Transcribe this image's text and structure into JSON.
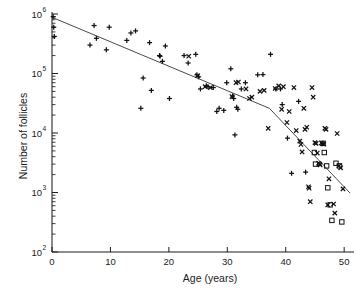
{
  "chart_data": {
    "type": "scatter",
    "title": "",
    "xlabel": "Age (years)",
    "ylabel": "Number of follicles",
    "xlim": [
      0,
      51
    ],
    "ylim": [
      100,
      1000000
    ],
    "yscale": "log",
    "xticks": [
      0,
      10,
      20,
      30,
      40,
      50
    ],
    "xticklabels": [
      "0",
      "10",
      "20",
      "30",
      "40",
      "50"
    ],
    "yticks": [
      100,
      1000,
      10000,
      100000,
      1000000
    ],
    "yticklabels": [
      "10²",
      "10³",
      "10⁴",
      "10⁵",
      "10⁶"
    ],
    "ytick_bases": [
      "10",
      "10",
      "10",
      "10",
      "10"
    ],
    "ytick_exponents": [
      "2",
      "3",
      "4",
      "5",
      "6"
    ],
    "grid": false,
    "legend": "none",
    "minor_ticks": "log-decade",
    "series": [
      {
        "name": "plus-marker-points",
        "marker": "plus",
        "points": [
          [
            0.2,
            900000
          ],
          [
            0.3,
            600000
          ],
          [
            0.4,
            420000
          ],
          [
            6.5,
            300000
          ],
          [
            7.2,
            640000
          ],
          [
            7.6,
            390000
          ],
          [
            9.3,
            250000
          ],
          [
            9.8,
            600000
          ],
          [
            12.8,
            360000
          ],
          [
            13.5,
            480000
          ],
          [
            14.3,
            520000
          ],
          [
            15.2,
            26000
          ],
          [
            15.6,
            84000
          ],
          [
            16.7,
            330000
          ],
          [
            17.0,
            52000
          ],
          [
            18.4,
            200000
          ],
          [
            18.5,
            195000
          ],
          [
            18.9,
            160000
          ],
          [
            19.4,
            290000
          ],
          [
            20.1,
            38000
          ],
          [
            22.6,
            200000
          ],
          [
            23.3,
            150000
          ],
          [
            24.6,
            210000
          ],
          [
            24.8,
            95000
          ],
          [
            25.1,
            88000
          ],
          [
            25.4,
            55000
          ],
          [
            26.4,
            62000
          ],
          [
            26.7,
            60000
          ],
          [
            27.6,
            58000
          ],
          [
            28.2,
            23000
          ],
          [
            28.6,
            26000
          ],
          [
            29.4,
            24000
          ],
          [
            29.9,
            70000
          ],
          [
            30.6,
            120000
          ],
          [
            30.9,
            42000
          ],
          [
            31.1,
            38000
          ],
          [
            31.3,
            9300
          ],
          [
            31.6,
            27000
          ],
          [
            31.8,
            25000
          ],
          [
            32.4,
            55000
          ],
          [
            33.1,
            70000
          ],
          [
            35.2,
            95000
          ],
          [
            36.1,
            96000
          ],
          [
            37.4,
            210000
          ],
          [
            38.3,
            55000
          ],
          [
            39.1,
            55000
          ],
          [
            39.4,
            30000
          ],
          [
            40.3,
            8200
          ],
          [
            41.0,
            2100
          ],
          [
            42.2,
            34000
          ],
          [
            43.4,
            2200
          ]
        ]
      },
      {
        "name": "cross-marker-points",
        "marker": "cross",
        "points": [
          [
            23.4,
            195000
          ],
          [
            24.9,
            92000
          ],
          [
            26.2,
            60000
          ],
          [
            27.1,
            58000
          ],
          [
            30.8,
            41000
          ],
          [
            31.5,
            70000
          ],
          [
            31.9,
            72000
          ],
          [
            33.2,
            55000
          ],
          [
            33.8,
            38000
          ],
          [
            34.2,
            40000
          ],
          [
            35.6,
            50000
          ],
          [
            36.3,
            52000
          ],
          [
            37.0,
            12000
          ],
          [
            38.2,
            56000
          ],
          [
            38.8,
            62000
          ],
          [
            39.3,
            25000
          ],
          [
            39.6,
            60000
          ],
          [
            40.2,
            15000
          ],
          [
            40.6,
            23000
          ],
          [
            41.4,
            58000
          ],
          [
            41.8,
            11000
          ],
          [
            42.4,
            7300
          ],
          [
            42.6,
            6400
          ],
          [
            42.8,
            4800
          ],
          [
            43.1,
            26000
          ],
          [
            43.3,
            11500
          ],
          [
            43.6,
            12500
          ],
          [
            43.9,
            1250
          ],
          [
            44.0,
            1180
          ],
          [
            44.2,
            700
          ],
          [
            44.5,
            58000
          ],
          [
            44.7,
            40000
          ],
          [
            45.0,
            6900
          ],
          [
            45.2,
            6700
          ],
          [
            45.4,
            4600
          ],
          [
            45.6,
            3100
          ],
          [
            45.8,
            3000
          ],
          [
            45.9,
            2900
          ],
          [
            46.1,
            6800
          ],
          [
            46.3,
            6600
          ],
          [
            46.5,
            6500
          ],
          [
            46.7,
            12000
          ],
          [
            46.9,
            11500
          ],
          [
            47.2,
            620
          ],
          [
            47.4,
            1700
          ],
          [
            48.2,
            640
          ],
          [
            48.4,
            450
          ],
          [
            48.8,
            9800
          ],
          [
            49.1,
            2800
          ],
          [
            49.4,
            2600
          ],
          [
            49.8,
            1150
          ]
        ]
      },
      {
        "name": "square-marker-points",
        "marker": "square",
        "points": [
          [
            44.9,
            4700
          ],
          [
            45.1,
            3000
          ],
          [
            46.4,
            6700
          ],
          [
            46.6,
            4700
          ],
          [
            47.0,
            2800
          ],
          [
            47.2,
            1200
          ],
          [
            47.6,
            620
          ],
          [
            47.9,
            340
          ],
          [
            48.6,
            3100
          ],
          [
            49.2,
            2800
          ],
          [
            49.6,
            320
          ]
        ]
      }
    ],
    "trend_line": {
      "name": "fitted-piecewise-decline",
      "segments": [
        {
          "from": [
            0,
            880000
          ],
          "to": [
            37.2,
            26000
          ]
        },
        {
          "from": [
            37.2,
            26000
          ],
          "to": [
            51.0,
            980
          ]
        }
      ],
      "breakpoint_age": 37.2
    }
  },
  "axes": {
    "x_axis_name": "age-axis",
    "y_axis_name": "follicle-count-axis"
  }
}
